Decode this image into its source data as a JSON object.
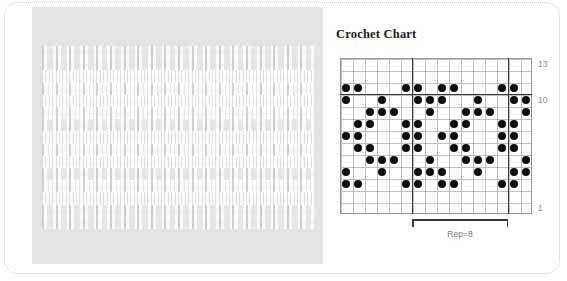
{
  "page": {
    "background_color": "#ffffff",
    "border_style": "dotted-rounded",
    "border_color": "#c9c9c9"
  },
  "photo": {
    "name": "crochet-lace-swatch-photo",
    "alt": "White crochet lace swatch photographed on a light gray background",
    "background_color": "#e3e3e1",
    "swatch_color": "#fdfdfd"
  },
  "chart": {
    "title": "Crochet Chart",
    "repeat_label": "Rep=8",
    "repeat_start_col": 7,
    "repeat_end_col": 14,
    "columns": 16,
    "rows": 13,
    "grid_color": "#bfbfbf",
    "heavy_line_color": "#3a3a3a",
    "dot_color": "#0d0d0d",
    "label_color": "#8c8c8c",
    "heavy_vertical_cols": [
      6,
      14
    ],
    "heavy_horizontal_rows": [
      10
    ],
    "row_labels": [
      {
        "row": 13,
        "text": "13"
      },
      {
        "row": 10,
        "text": "10"
      },
      {
        "row": 1,
        "text": "1"
      }
    ]
  },
  "chart_data": {
    "type": "heatmap",
    "title": "Crochet Chart",
    "xlabel": "",
    "ylabel": "",
    "note": "Binary crochet stitch chart. Rows numbered 1 (bottom) to 13 (top); columns 1 (left) to 16 (right). A filled dot marks a worked stitch symbol.",
    "columns": [
      1,
      2,
      3,
      4,
      5,
      6,
      7,
      8,
      9,
      10,
      11,
      12,
      13,
      14,
      15,
      16
    ],
    "rows": [
      13,
      12,
      11,
      10,
      9,
      8,
      7,
      6,
      5,
      4,
      3,
      2,
      1
    ],
    "filled_cells": {
      "13": [],
      "12": [],
      "11": [
        1,
        2,
        6,
        7,
        9,
        10,
        14,
        15
      ],
      "10": [
        1,
        4,
        7,
        8,
        9,
        12,
        15,
        16
      ],
      "9": [
        3,
        4,
        5,
        8,
        11,
        12,
        13,
        16
      ],
      "8": [
        2,
        3,
        6,
        7,
        10,
        11,
        14,
        15
      ],
      "7": [
        1,
        2,
        6,
        7,
        9,
        10,
        14,
        15
      ],
      "6": [
        2,
        3,
        6,
        7,
        10,
        11,
        14,
        15
      ],
      "5": [
        3,
        4,
        5,
        8,
        11,
        12,
        13,
        16
      ],
      "4": [
        1,
        4,
        7,
        8,
        9,
        12,
        15,
        16
      ],
      "3": [
        1,
        2,
        6,
        7,
        9,
        10,
        14,
        15
      ],
      "2": [],
      "1": []
    }
  }
}
